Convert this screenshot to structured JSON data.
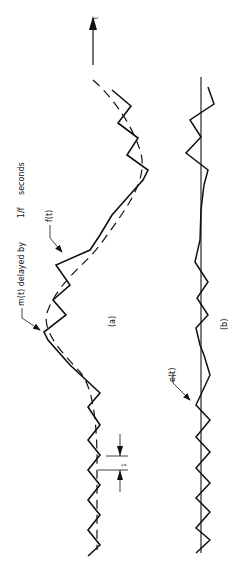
{
  "figure": {
    "orientation": "rotated-90-ccw",
    "time_axis_label": "t",
    "panel_a": {
      "caption": "(a)",
      "label_m": "m(t) delayed by",
      "label_m_frac": "1/f",
      "label_m_sub": "s",
      "label_m_unit": "seconds",
      "label_f": "f(t)",
      "interval_label": "1",
      "interval_sub": "f",
      "interval_sub2": "s"
    },
    "panel_b": {
      "caption": "(b)",
      "label_e": "e(t)"
    },
    "colors": {
      "ink": "#111111",
      "background": "#ffffff"
    }
  }
}
